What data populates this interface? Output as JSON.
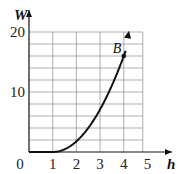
{
  "chart_data": {
    "type": "line",
    "title": "",
    "xlabel": "h",
    "ylabel": "W",
    "xlim": [
      0,
      4.8
    ],
    "ylim": [
      0,
      20
    ],
    "x_ticks": [
      0,
      1,
      2,
      3,
      4,
      5
    ],
    "x_tick_labels": [
      "0",
      "1",
      "2",
      "3",
      "4",
      "5"
    ],
    "y_ticks": [
      10,
      20
    ],
    "y_tick_labels": [
      "10",
      "20"
    ],
    "grid": true,
    "grid_x_step": 1,
    "grid_y_step": 2,
    "series": [
      {
        "name": "W(h)",
        "x": [
          0,
          0.5,
          1,
          1.5,
          2,
          2.5,
          3,
          3.5,
          4,
          4.2
        ],
        "y": [
          0,
          0,
          0,
          0.44,
          1.78,
          4,
          7.11,
          11.1,
          16,
          19.5
        ]
      }
    ],
    "annotations": [
      {
        "label": "B",
        "x": 4,
        "y": 16
      }
    ]
  }
}
